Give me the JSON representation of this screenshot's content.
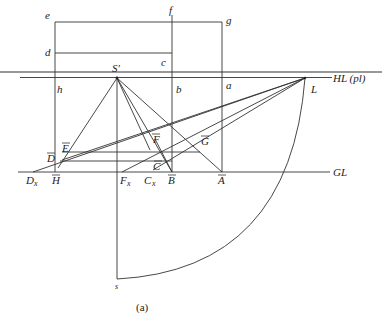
{
  "figure": {
    "caption": "(a)",
    "colors": {
      "line": "#333333",
      "text": "#222222",
      "background": "#ffffff"
    }
  },
  "labels": {
    "e": "e",
    "f": "f",
    "g": "g",
    "d": "d",
    "c": "c",
    "h": "h",
    "b": "b",
    "a": "a",
    "S_prime": "S′",
    "HL": "HL (pl)",
    "L": "L",
    "E_bar": "E",
    "D_bar": "D",
    "F_bar": "F",
    "G_bar": "G",
    "C_bar": "C",
    "H_bar": "H",
    "B_bar": "B",
    "A_bar": "A",
    "Dx": "D",
    "Dx_sub": "x",
    "Fx": "F",
    "Fx_sub": "x",
    "Cx": "C",
    "Cx_sub": "x",
    "GL": "GL",
    "s": "s"
  }
}
